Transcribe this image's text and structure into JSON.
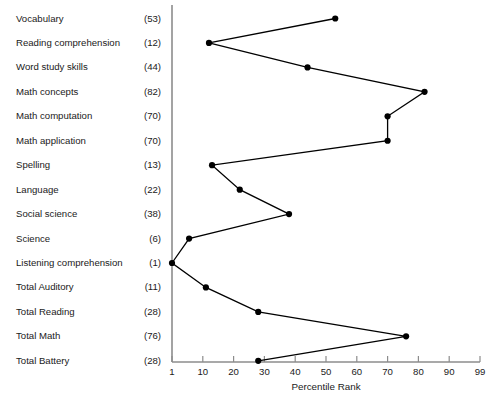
{
  "chart_data": {
    "type": "line",
    "orientation": "horizontal-categories",
    "title": "",
    "xlabel": "Percentile Rank",
    "ylabel": "",
    "xlim": [
      1,
      99
    ],
    "xticks": [
      1,
      10,
      20,
      30,
      40,
      50,
      60,
      70,
      80,
      90,
      99
    ],
    "xtick_labels": [
      "1",
      "10",
      "20",
      "30",
      "40",
      "50",
      "60",
      "70",
      "80",
      "90",
      "99"
    ],
    "grid": false,
    "legend": false,
    "marker": "filled-circle",
    "line_color": "#000000",
    "marker_color": "#000000",
    "axis_color": "#808080",
    "categories": [
      "Vocabulary",
      "Reading comprehension",
      "Word study skills",
      "Math concepts",
      "Math computation",
      "Math application",
      "Spelling",
      "Language",
      "Social science",
      "Science",
      "Listening comprehension",
      "Total Auditory",
      "Total Reading",
      "Total Math",
      "Total Battery"
    ],
    "values": [
      53,
      12,
      44,
      82,
      70,
      70,
      13,
      22,
      38,
      6,
      1,
      11,
      28,
      76,
      28
    ],
    "value_labels": [
      "(53)",
      "(12)",
      "(44)",
      "(82)",
      "(70)",
      "(70)",
      "(13)",
      "(22)",
      "(38)",
      "(6)",
      "(1)",
      "(11)",
      "(28)",
      "(76)",
      "(28)"
    ],
    "points": [
      {
        "category": "Vocabulary",
        "value": 53,
        "label": "(53)"
      },
      {
        "category": "Reading comprehension",
        "value": 12,
        "label": "(12)"
      },
      {
        "category": "Word study skills",
        "value": 44,
        "label": "(44)"
      },
      {
        "category": "Math concepts",
        "value": 82,
        "label": "(82)"
      },
      {
        "category": "Math computation",
        "value": 70,
        "label": "(70)"
      },
      {
        "category": "Math application",
        "value": 70,
        "label": "(70)"
      },
      {
        "category": "Spelling",
        "value": 13,
        "label": "(13)"
      },
      {
        "category": "Language",
        "value": 22,
        "label": "(22)"
      },
      {
        "category": "Social science",
        "value": 38,
        "label": "(38)"
      },
      {
        "category": "Science",
        "value": 6,
        "label": "(6)"
      },
      {
        "category": "Listening comprehension",
        "value": 1,
        "label": "(1)"
      },
      {
        "category": "Total Auditory",
        "value": 11,
        "label": "(11)"
      },
      {
        "category": "Total Reading",
        "value": 28,
        "label": "(28)"
      },
      {
        "category": "Total Math",
        "value": 76,
        "label": "(76)"
      },
      {
        "category": "Total Battery",
        "value": 28,
        "label": "(28)"
      }
    ]
  }
}
